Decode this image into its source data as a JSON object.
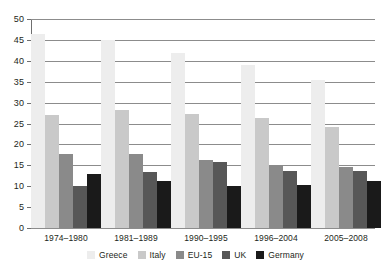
{
  "chart_data": {
    "type": "bar",
    "title": "",
    "subtitle": "",
    "xlabel": "",
    "ylabel": "",
    "ylim": [
      0,
      50
    ],
    "yticks": [
      0,
      5,
      10,
      15,
      20,
      25,
      30,
      35,
      40,
      45,
      50
    ],
    "grid": true,
    "grid_axis": "y",
    "legend_position": "bottom",
    "categories": [
      "1974–1980",
      "1981–1989",
      "1990–1995",
      "1996–2004",
      "2005–2008"
    ],
    "series": [
      {
        "name": "Greece",
        "color": "#ededed",
        "values": [
          46.5,
          45.0,
          41.8,
          39.0,
          35.3
        ]
      },
      {
        "name": "Italy",
        "color": "#c9c9c9",
        "values": [
          27.0,
          28.3,
          27.2,
          26.3,
          24.2
        ]
      },
      {
        "name": "EU-15",
        "color": "#8a8a8a",
        "values": [
          17.8,
          17.7,
          16.3,
          15.0,
          14.6
        ]
      },
      {
        "name": "UK",
        "color": "#575757",
        "values": [
          10.0,
          13.4,
          15.7,
          13.6,
          13.7
        ]
      },
      {
        "name": "Germany",
        "color": "#1a1a1a",
        "values": [
          13.0,
          11.3,
          10.1,
          10.4,
          11.2
        ]
      }
    ]
  },
  "colors": {
    "axis": "#6f6f6f",
    "gridline": "#8c8c8c",
    "text": "#231f20",
    "background": "#ffffff"
  }
}
